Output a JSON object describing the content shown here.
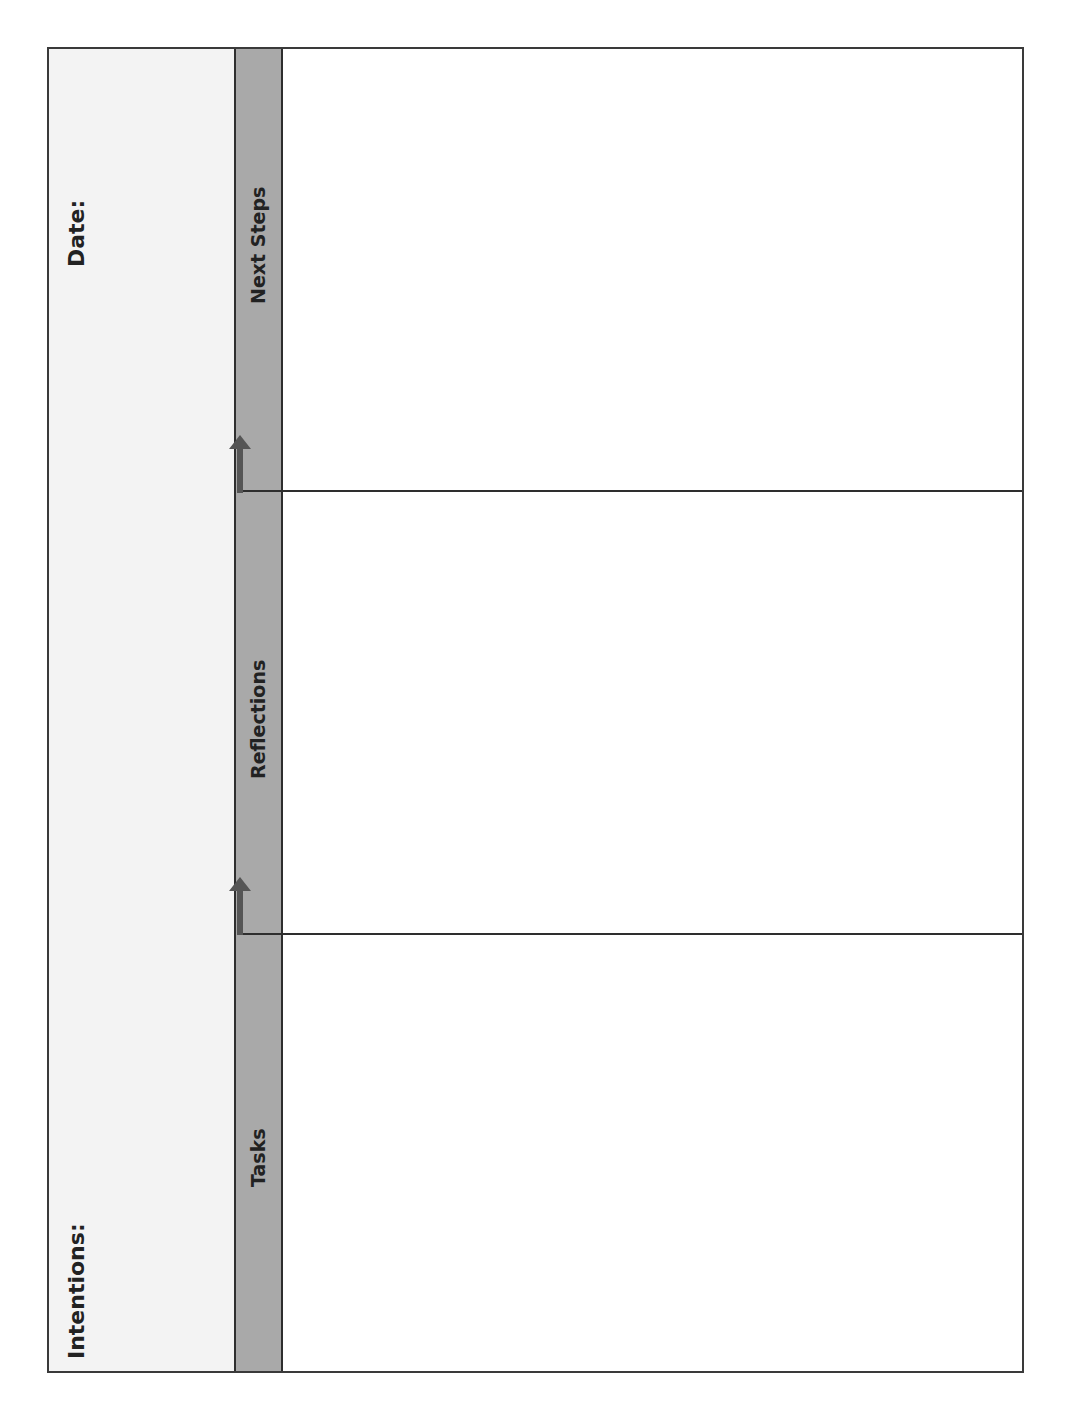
{
  "header": {
    "date_label": "Date:",
    "intentions_label": "Intentions:"
  },
  "sections": [
    {
      "label": "Next Steps"
    },
    {
      "label": "Reflections"
    },
    {
      "label": "Tasks"
    }
  ],
  "colors": {
    "header_bg": "#f3f3f3",
    "band_bg": "#a9a9a9",
    "line": "#2e2e2e",
    "arrow": "#555555"
  }
}
